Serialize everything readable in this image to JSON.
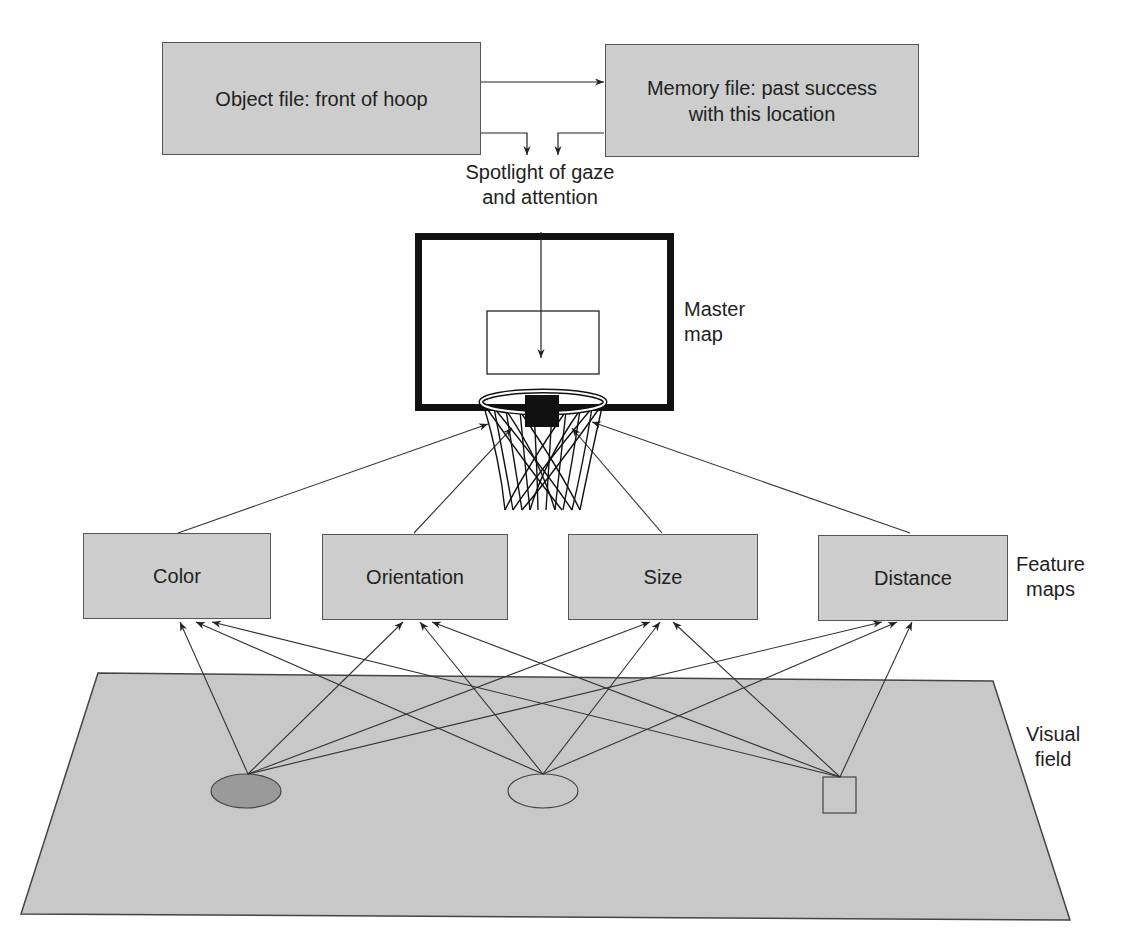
{
  "top": {
    "object_file": "Object file: front of hoop",
    "memory_file_line1": "Memory file: past success",
    "memory_file_line2": "with this location"
  },
  "spotlight": {
    "line1": "Spotlight of gaze",
    "line2": "and attention"
  },
  "master_map": {
    "line1": "Master",
    "line2": "map"
  },
  "feature_maps": {
    "label_line1": "Feature",
    "label_line2": "maps",
    "boxes": [
      "Color",
      "Orientation",
      "Size",
      "Distance"
    ]
  },
  "visual_field": {
    "label_line1": "Visual",
    "label_line2": "field",
    "objects": [
      "dark-ellipse",
      "light-ellipse",
      "square"
    ]
  },
  "colors": {
    "box_fill": "#cdcdcd",
    "field_fill": "#c8c8c8",
    "dark_ellipse": "#9a9a9a",
    "stroke": "#333333"
  }
}
